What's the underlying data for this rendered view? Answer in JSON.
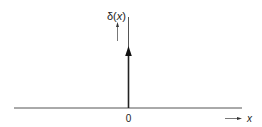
{
  "diagram": {
    "function_label": "δ(x)",
    "function_label_main": "δ(",
    "function_label_var": "x",
    "function_label_close": ")",
    "origin_label": "0",
    "x_axis_label": "x",
    "colors": {
      "line": "#333333",
      "text": "#222222",
      "background": "#ffffff"
    }
  }
}
